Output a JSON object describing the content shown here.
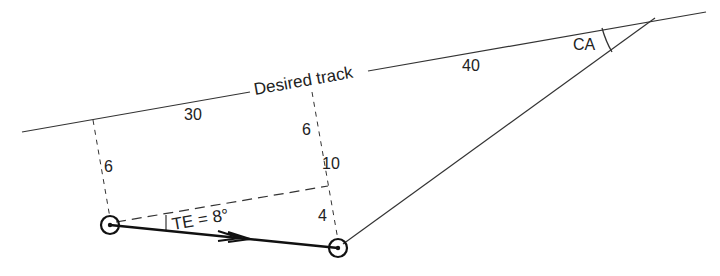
{
  "labels": {
    "desired_track": "Desired track",
    "dist_30": "30",
    "dist_40": "40",
    "ca": "CA",
    "te": "TE = 8°",
    "left_offset": "6",
    "right_offset_upper": "6",
    "right_offset_mid": "10",
    "right_offset_lower": "4"
  },
  "colors": {
    "line": "#333333",
    "heavy": "#111111",
    "text": "#222222"
  }
}
